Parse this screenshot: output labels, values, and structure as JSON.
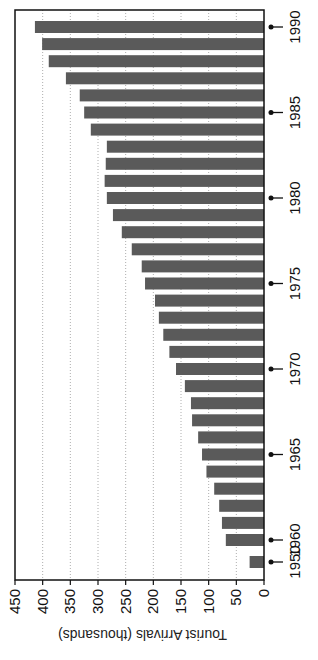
{
  "chart_data": {
    "type": "bar",
    "orientation": "rotated-90-clockwise",
    "title": "",
    "xlabel": "",
    "ylabel": "Tourist Arrivals (thousands)",
    "ylim": [
      0,
      450
    ],
    "yticks": [
      0,
      50,
      100,
      150,
      200,
      250,
      300,
      350,
      400,
      450
    ],
    "grid": true,
    "categories": [
      "1950",
      "1960",
      "1961",
      "1962",
      "1963",
      "1964",
      "1965",
      "1966",
      "1967",
      "1968",
      "1969",
      "1970",
      "1971",
      "1972",
      "1973",
      "1974",
      "1975",
      "1976",
      "1977",
      "1978",
      "1979",
      "1980",
      "1981",
      "1982",
      "1983",
      "1984",
      "1985",
      "1986",
      "1987",
      "1988",
      "1989",
      "1990"
    ],
    "values": [
      26,
      69,
      76,
      81,
      90,
      104,
      112,
      119,
      130,
      132,
      143,
      159,
      171,
      182,
      190,
      197,
      215,
      221,
      239,
      257,
      273,
      284,
      288,
      286,
      284,
      313,
      325,
      333,
      358,
      389,
      401,
      414
    ],
    "xtick_labels": [
      "1950",
      "1960",
      "1965",
      "1970",
      "1975",
      "1980",
      "1985",
      "1990"
    ],
    "colors": {
      "bar": "#5a5a5a",
      "grid": "#999999",
      "axis": "#111111"
    }
  }
}
